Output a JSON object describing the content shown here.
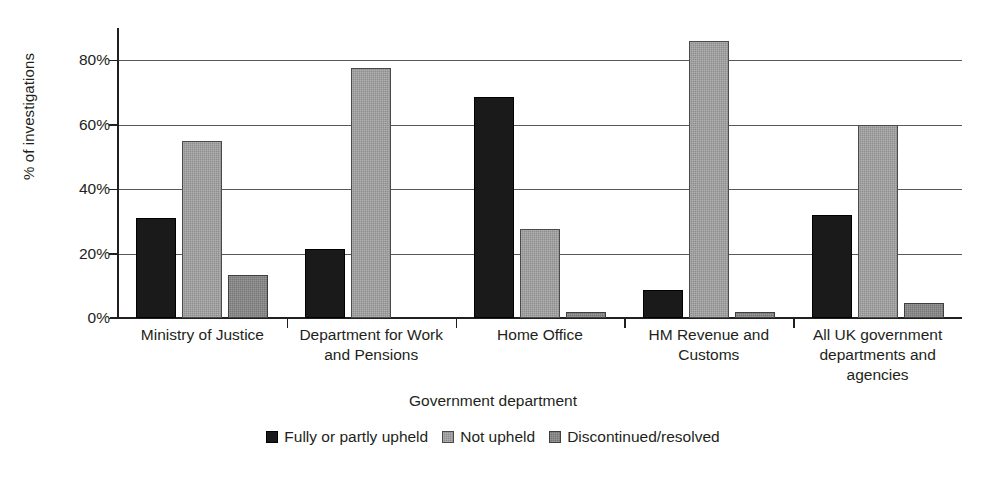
{
  "chart_data": {
    "type": "bar",
    "title": "",
    "subtitle": "",
    "xlabel": "Government department",
    "ylabel": "% of investigations",
    "ylim": [
      0,
      90
    ],
    "yticks": [
      0,
      20,
      40,
      60,
      80
    ],
    "ytick_labels": [
      "0%",
      "20%",
      "40%",
      "60%",
      "80%"
    ],
    "grid": true,
    "legend_position": "bottom",
    "categories": [
      "Ministry of Justice",
      "Department for Work and Pensions",
      "Home Office",
      "HM Revenue and Customs",
      "All UK government departments and agencies"
    ],
    "category_label_lines": [
      [
        "Ministry of Justice"
      ],
      [
        "Department for Work",
        "and Pensions"
      ],
      [
        "Home Office"
      ],
      [
        "HM Revenue and",
        "Customs"
      ],
      [
        "All UK government",
        "departments and",
        "agencies"
      ]
    ],
    "series": [
      {
        "name": "Fully or partly upheld",
        "color": "#1a1a1a",
        "values": [
          31,
          21.5,
          68.5,
          8.7,
          32
        ]
      },
      {
        "name": "Not upheld",
        "color": "#8e8e8e",
        "values": [
          55,
          77.5,
          27.5,
          86,
          60
        ]
      },
      {
        "name": "Discontinued/resolved",
        "color": "#767676",
        "values": [
          13.5,
          0,
          2,
          2,
          4.8
        ]
      }
    ]
  },
  "axis": {
    "y_title": "% of investigations",
    "x_title": "Government department"
  }
}
